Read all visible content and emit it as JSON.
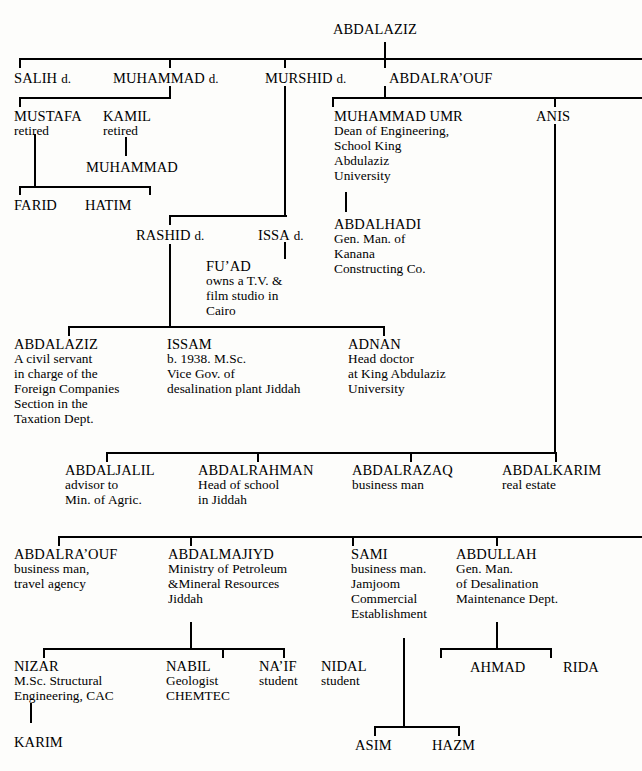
{
  "diagram": {
    "line_color": "#000000",
    "background": "#fdfdfb"
  },
  "people": {
    "root": {
      "name": "ABDALAZIZ",
      "suffix": "",
      "desc": []
    },
    "salih": {
      "name": "SALIH",
      "suffix": "d.",
      "desc": []
    },
    "muhammad_g2": {
      "name": "MUHAMMAD",
      "suffix": "d.",
      "desc": []
    },
    "murshid": {
      "name": "MURSHID",
      "suffix": "d.",
      "desc": []
    },
    "abdalraouf_g2": {
      "name": "ABDALRA’OUF",
      "suffix": "",
      "desc": []
    },
    "mustafa": {
      "name": "MUSTAFA",
      "suffix": "",
      "desc": [
        "retired"
      ]
    },
    "kamil": {
      "name": "KAMIL",
      "suffix": "",
      "desc": [
        "retired"
      ]
    },
    "muhammad_umr": {
      "name": "MUHAMMAD UMR",
      "suffix": "",
      "desc": [
        "Dean of Engineering,",
        "School King",
        "Abdulaziz",
        "University"
      ]
    },
    "anis": {
      "name": "ANIS",
      "suffix": "",
      "desc": []
    },
    "muhammad_g4": {
      "name": "MUHAMMAD",
      "suffix": "",
      "desc": []
    },
    "farid": {
      "name": "FARID",
      "suffix": "",
      "desc": []
    },
    "hatim": {
      "name": "HATIM",
      "suffix": "",
      "desc": []
    },
    "rashid": {
      "name": "RASHID",
      "suffix": "d.",
      "desc": []
    },
    "issa": {
      "name": "ISSA",
      "suffix": "d.",
      "desc": []
    },
    "abdalhadi": {
      "name": "ABDALHADI",
      "suffix": "",
      "desc": [
        "Gen. Man. of",
        "Kanana",
        "Constructing Co."
      ]
    },
    "fuad": {
      "name": "FU’AD",
      "suffix": "",
      "desc": [
        "owns a T.V. &",
        "film studio in",
        "Cairo"
      ]
    },
    "abdalaziz_g5": {
      "name": "ABDALAZIZ",
      "suffix": "",
      "desc": [
        "A civil servant",
        "in charge of the",
        "Foreign Companies",
        "Section in the",
        "Taxation Dept."
      ]
    },
    "issam": {
      "name": "ISSAM",
      "suffix": "",
      "desc": [
        "b. 1938. M.Sc.",
        "Vice Gov. of",
        "desalination plant Jiddah"
      ]
    },
    "adnan": {
      "name": "ADNAN",
      "suffix": "",
      "desc": [
        "Head doctor",
        "at King Abdulaziz",
        "University"
      ]
    },
    "abdaljalil": {
      "name": "ABDALJALIL",
      "suffix": "",
      "desc": [
        "advisor to",
        "Min. of Agric."
      ]
    },
    "abdalrahman": {
      "name": "ABDALRAHMAN",
      "suffix": "",
      "desc": [
        "Head of school",
        "in Jiddah"
      ]
    },
    "abdalrazaq": {
      "name": "ABDALRAZAQ",
      "suffix": "",
      "desc": [
        "business man"
      ]
    },
    "abdalkarim": {
      "name": "ABDALKARIM",
      "suffix": "",
      "desc": [
        "real estate"
      ]
    },
    "abdalraouf_g6": {
      "name": "ABDALRA’OUF",
      "suffix": "",
      "desc": [
        "business man,",
        "travel agency"
      ]
    },
    "abdalmajiyd": {
      "name": "ABDALMAJIYD",
      "suffix": "",
      "desc": [
        "Ministry of Petroleum",
        "&Mineral Resources",
        "Jiddah"
      ]
    },
    "sami": {
      "name": "SAMI",
      "suffix": "",
      "desc": [
        "business man.",
        "Jamjoom",
        "Commercial",
        "Establishment"
      ]
    },
    "abdullah": {
      "name": "ABDULLAH",
      "suffix": "",
      "desc": [
        "Gen. Man.",
        "of Desalination",
        "Maintenance Dept."
      ]
    },
    "nizar": {
      "name": "NIZAR",
      "suffix": "",
      "desc": [
        "M.Sc. Structural",
        "Engineering, CAC"
      ]
    },
    "nabil": {
      "name": "NABIL",
      "suffix": "",
      "desc": [
        "Geologist",
        "CHEMTEC"
      ]
    },
    "naif": {
      "name": "NA’IF",
      "suffix": "",
      "desc": [
        "student"
      ]
    },
    "nidal": {
      "name": "NIDAL",
      "suffix": "",
      "desc": [
        "student"
      ]
    },
    "ahmad": {
      "name": "AHMAD",
      "suffix": "",
      "desc": []
    },
    "rida": {
      "name": "RIDA",
      "suffix": "",
      "desc": []
    },
    "karim": {
      "name": "KARIM",
      "suffix": "",
      "desc": []
    },
    "asim": {
      "name": "ASIM",
      "suffix": "",
      "desc": []
    },
    "hazm": {
      "name": "HAZM",
      "suffix": "",
      "desc": []
    }
  }
}
